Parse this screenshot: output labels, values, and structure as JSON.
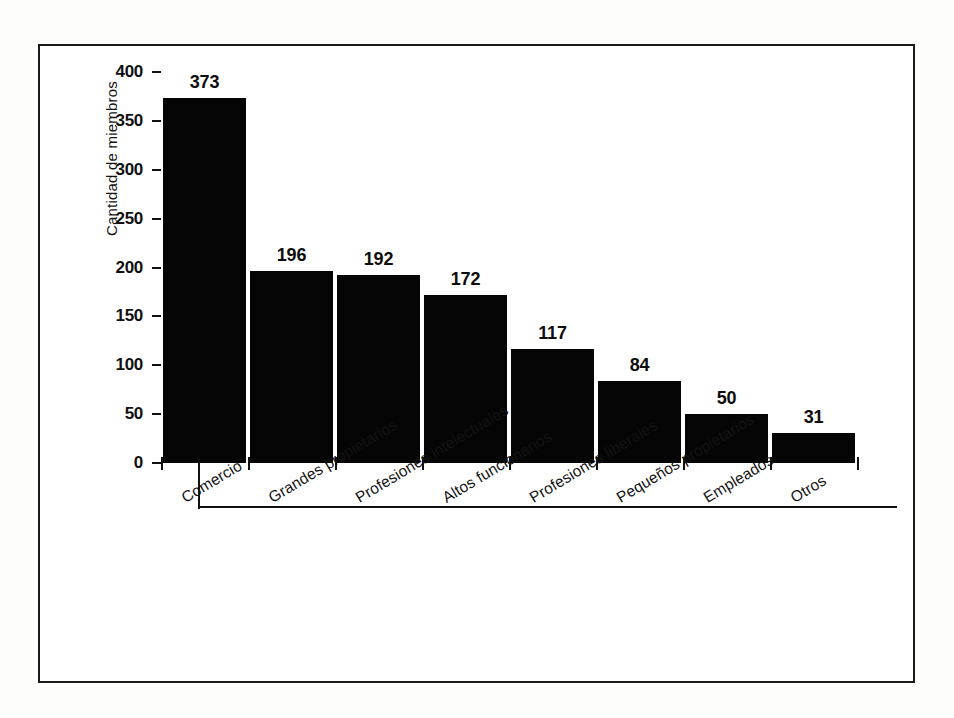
{
  "chart_data": {
    "type": "bar",
    "title": "",
    "subtitle": "",
    "xlabel": "",
    "ylabel": "Cantidad de miembros",
    "categories": [
      "Comercio",
      "Grandes propietarios",
      "Profesiones intelectuales",
      "Altos funcionarios",
      "Profesiones liberales",
      "Pequeños propietarios",
      "Empleados",
      "Otros"
    ],
    "values": [
      373,
      196,
      192,
      172,
      117,
      84,
      50,
      31
    ],
    "value_labels": [
      "373",
      "196",
      "192",
      "172",
      "117",
      "84",
      "50",
      "31"
    ],
    "ylim": [
      0,
      400
    ],
    "y_ticks": [
      0,
      50,
      100,
      150,
      200,
      250,
      300,
      350,
      400
    ],
    "y_tick_labels": [
      "0",
      "50",
      "100",
      "150",
      "200",
      "250",
      "300",
      "350",
      "400"
    ],
    "grid": false,
    "legend": false,
    "legend_position": "none",
    "bar_color": "#050505",
    "axis_color": "#111111",
    "background_color": "#ffffff",
    "data_labels_shown": true,
    "x_tick_label_rotation": -31
  }
}
